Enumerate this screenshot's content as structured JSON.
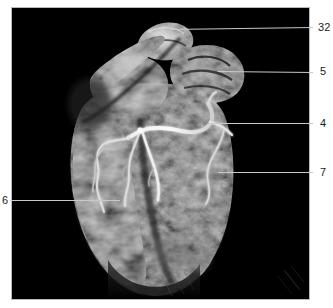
{
  "figure": {
    "type": "volume-rendered-cardiac-image",
    "modality_appearance": "grayscale 3D volume render of heart on black background",
    "panel": {
      "x": 11,
      "y": 7,
      "width": 299,
      "height": 293,
      "background_color": "#000000",
      "border_color": "#b9b9b9"
    },
    "canvas_background": "#000000",
    "tissue_color": "#9a9a9a",
    "vessel_color": "#f2f2f2",
    "leader_color": "#c9c9c9",
    "label_color": "#1b1b1b"
  },
  "annotations": [
    {
      "id": "label-32",
      "text": "32",
      "side": "right",
      "label_x": 318,
      "label_y": 22,
      "line_x1": 170,
      "line_y1": 29,
      "line_x2": 313,
      "line_y2": 27,
      "target": "superior great vessel / ascending structure at top of volume"
    },
    {
      "id": "label-5",
      "text": "5",
      "side": "right",
      "label_x": 320,
      "label_y": 66,
      "line_x1": 218,
      "line_y1": 71,
      "line_x2": 313,
      "line_y2": 72,
      "target": "right atrial appendage / upper right chamber wall"
    },
    {
      "id": "label-4",
      "text": "4",
      "side": "right",
      "label_x": 320,
      "label_y": 118,
      "line_x1": 208,
      "line_y1": 123,
      "line_x2": 313,
      "line_y2": 123,
      "target": "right coronary artery in atrioventricular groove"
    },
    {
      "id": "label-7",
      "text": "7",
      "side": "right",
      "label_x": 320,
      "label_y": 167,
      "line_x1": 218,
      "line_y1": 172,
      "line_x2": 313,
      "line_y2": 172,
      "target": "right ventricular free wall myocardium"
    },
    {
      "id": "label-6",
      "text": "6",
      "side": "left",
      "label_x": 2,
      "label_y": 195,
      "line_x1": 10,
      "line_y1": 200,
      "line_x2": 120,
      "line_y2": 200,
      "target": "left ventricular wall / anterior interventricular region"
    }
  ]
}
